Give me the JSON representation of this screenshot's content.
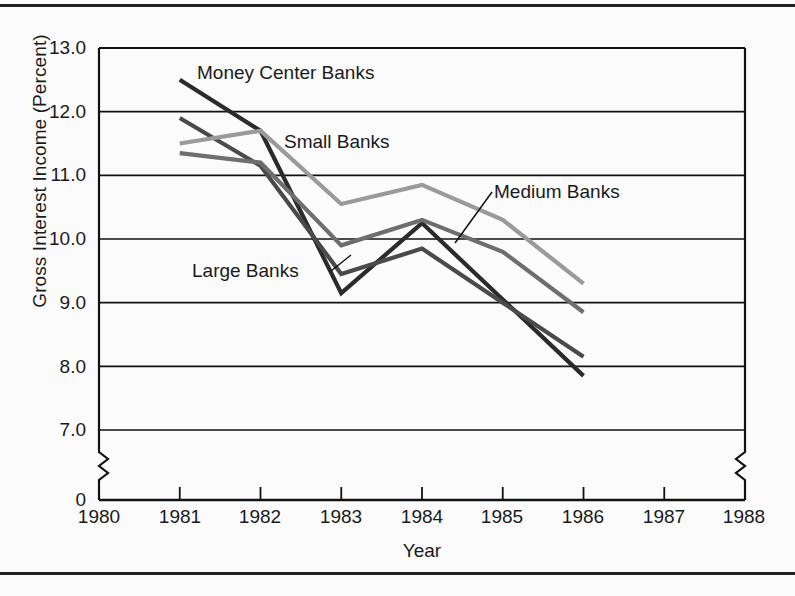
{
  "chart_data": {
    "type": "line",
    "title": "",
    "xlabel": "Year",
    "ylabel": "Gross Interest Income (Percent)",
    "x": [
      1981,
      1982,
      1983,
      1984,
      1985,
      1986
    ],
    "xlim": [
      1980,
      1988
    ],
    "ylim": [
      7.0,
      13.0
    ],
    "y_axis_break": true,
    "y_zero_label": "0",
    "grid": "horizontal",
    "legend": "inline-annotations",
    "xticklabels": [
      "1980",
      "1981",
      "1982",
      "1983",
      "1984",
      "1985",
      "1986",
      "1987",
      "1988"
    ],
    "yticklabels": [
      "13.0",
      "12.0",
      "11.0",
      "10.0",
      "9.0",
      "8.0",
      "7.0",
      "0"
    ],
    "series": [
      {
        "name": "Money Center Banks",
        "color": "#2b2b2b",
        "values": [
          12.5,
          11.7,
          9.15,
          10.25,
          9.05,
          7.85
        ]
      },
      {
        "name": "Large Banks",
        "color": "#4a4a4a",
        "values": [
          11.9,
          11.15,
          9.45,
          9.85,
          9.0,
          8.15
        ]
      },
      {
        "name": "Medium Banks",
        "color": "#6e6e6e",
        "values": [
          11.35,
          11.2,
          9.9,
          10.3,
          9.8,
          8.85
        ]
      },
      {
        "name": "Small Banks",
        "color": "#9a9a9a",
        "values": [
          11.5,
          11.7,
          10.55,
          10.85,
          10.3,
          9.3
        ]
      }
    ],
    "annotations": [
      {
        "text": "Money Center Banks",
        "series": "Money Center Banks"
      },
      {
        "text": "Small Banks",
        "series": "Small Banks"
      },
      {
        "text": "Medium Banks",
        "series": "Medium Banks"
      },
      {
        "text": "Large Banks",
        "series": "Large Banks"
      }
    ]
  },
  "axis": {
    "xlabel": "Year",
    "ylabel": "Gross Interest Income (Percent)"
  },
  "yticks": [
    {
      "label": "13.0"
    },
    {
      "label": "12.0"
    },
    {
      "label": "11.0"
    },
    {
      "label": "10.0"
    },
    {
      "label": "9.0"
    },
    {
      "label": "8.0"
    },
    {
      "label": "7.0"
    },
    {
      "label": "0"
    }
  ],
  "xticks": [
    {
      "label": "1980"
    },
    {
      "label": "1981"
    },
    {
      "label": "1982"
    },
    {
      "label": "1983"
    },
    {
      "label": "1984"
    },
    {
      "label": "1985"
    },
    {
      "label": "1986"
    },
    {
      "label": "1987"
    },
    {
      "label": "1988"
    }
  ],
  "labels": {
    "money_center": "Money Center Banks",
    "small": "Small Banks",
    "medium": "Medium Banks",
    "large": "Large Banks"
  }
}
